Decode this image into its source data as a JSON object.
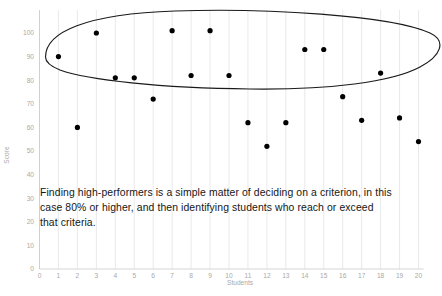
{
  "chart_data": {
    "type": "scatter",
    "title": "",
    "subtitle": "",
    "xlabel": "Students",
    "ylabel": "Score",
    "xlim": [
      0,
      20
    ],
    "ylim": [
      0,
      100
    ],
    "x_ticks": [
      0,
      1,
      2,
      3,
      4,
      5,
      6,
      7,
      8,
      9,
      10,
      11,
      12,
      13,
      14,
      15,
      16,
      17,
      18,
      19,
      20
    ],
    "y_ticks": [
      0,
      10,
      20,
      30,
      40,
      50,
      60,
      70,
      80,
      90,
      100
    ],
    "grid": "vertical-only",
    "legend": "none",
    "marker_color": "#000000",
    "series": [
      {
        "name": "Student scores",
        "x": [
          1,
          2,
          3,
          4,
          5,
          6,
          7,
          8,
          9,
          10,
          11,
          12,
          13,
          14,
          15,
          16,
          17,
          18,
          19,
          20
        ],
        "values": [
          90,
          60,
          100,
          81,
          81,
          72,
          101,
          82,
          101,
          82,
          62,
          52,
          62,
          93,
          93,
          73,
          63,
          83,
          64,
          54
        ]
      }
    ],
    "annotations": [
      {
        "name": "high-performers-oval",
        "shape": "ellipse",
        "description": "Hand-drawn oval encircling the high scorers (80 and above)"
      },
      {
        "name": "caption",
        "shape": "text",
        "text": "Finding high-performers is a simple matter of deciding on a criterion, in this case 80% or higher, and then identifying students who reach or exceed that criteria."
      }
    ]
  },
  "chart": {
    "y_axis_title": "Score",
    "x_axis_title": "Students",
    "y_tick_labels": [
      "100",
      "90",
      "80",
      "70",
      "60",
      "50",
      "40",
      "30",
      "20",
      "10",
      "0"
    ],
    "x_tick_labels": [
      "0",
      "1",
      "2",
      "3",
      "4",
      "5",
      "6",
      "7",
      "8",
      "9",
      "10",
      "11",
      "12",
      "13",
      "14",
      "15",
      "16",
      "17",
      "18",
      "19",
      "20"
    ],
    "caption": "Finding high-performers is a simple matter of deciding on a criterion, in this case 80% or higher, and then identifying students who reach or exceed that criteria.",
    "colors": {
      "marker": "#000000",
      "axis_text": "#a9a9a9",
      "gridline": "#e6e6e6",
      "axis_line": "#d0d0d0",
      "oval": "#1a1a1a",
      "caption_text": "#161616",
      "background": "#ffffff"
    }
  }
}
